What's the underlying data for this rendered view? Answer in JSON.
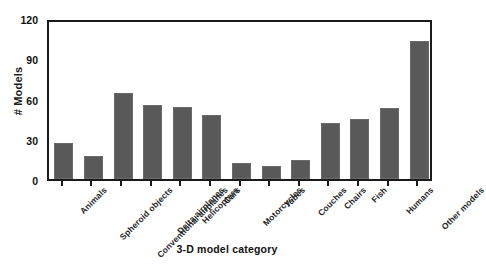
{
  "chart_data": {
    "type": "bar",
    "title": "",
    "xlabel": "3-D model category",
    "ylabel": "# Models",
    "categories": [
      "Animals",
      "Spheroid objects",
      "Conventional airplanes",
      "Delta airplanes",
      "Helicopters",
      "Cars",
      "Motorcycles",
      "Tubes",
      "Couches",
      "Chairs",
      "Fish",
      "Humans",
      "Other models"
    ],
    "values": [
      27,
      17,
      64,
      55,
      54,
      48,
      12,
      10,
      14,
      42,
      45,
      53,
      103
    ],
    "ylim": [
      0,
      120
    ],
    "yticks": [
      0,
      30,
      60,
      90,
      120
    ],
    "ytick_labels": [
      "0",
      "30",
      "60",
      "90",
      "120"
    ],
    "grid": false,
    "legend": false,
    "bar_color": "#595959",
    "axis_color": "#1a1a1a",
    "background": "#ffffff"
  }
}
